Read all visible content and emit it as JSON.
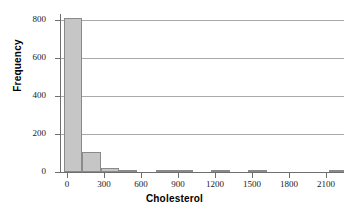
{
  "chart_data": {
    "type": "bar",
    "title": "",
    "subtitle": "",
    "xlabel": "Cholesterol",
    "ylabel": "Frequency",
    "xlim": [
      -60,
      2250
    ],
    "ylim": [
      0,
      830
    ],
    "grid": "horizontal",
    "legend": "none",
    "bin_width": 150,
    "x_ticks": [
      0,
      300,
      600,
      900,
      1200,
      1500,
      1800,
      2100
    ],
    "x_tick_labels": [
      "0",
      "300",
      "600",
      "900",
      "1200",
      "1500",
      "1800",
      "2100"
    ],
    "y_ticks": [
      0,
      200,
      400,
      600,
      800
    ],
    "y_tick_labels": [
      "0",
      "200",
      "400",
      "600",
      "800"
    ],
    "bins": [
      {
        "start": -30,
        "end": 120,
        "center": 45,
        "value": 810
      },
      {
        "start": 120,
        "end": 270,
        "center": 195,
        "value": 105
      },
      {
        "start": 270,
        "end": 420,
        "center": 345,
        "value": 20
      },
      {
        "start": 420,
        "end": 570,
        "center": 495,
        "value": 5
      },
      {
        "start": 720,
        "end": 870,
        "center": 795,
        "value": 8
      },
      {
        "start": 870,
        "end": 1020,
        "center": 945,
        "value": 3
      },
      {
        "start": 1170,
        "end": 1320,
        "center": 1245,
        "value": 2
      },
      {
        "start": 1470,
        "end": 1620,
        "center": 1545,
        "value": 2
      },
      {
        "start": 2130,
        "end": 2250,
        "center": 2190,
        "value": 3
      }
    ],
    "categories": [
      "45",
      "195",
      "345",
      "495",
      "795",
      "945",
      "1245",
      "1545",
      "2190"
    ],
    "values": [
      810,
      105,
      20,
      5,
      8,
      3,
      2,
      2,
      3
    ],
    "colors": {
      "bar_fill": "#c6c6c6",
      "bar_edge": "#8a8a8a",
      "gridline": "#a9a9a9",
      "axis": "#6e6e6e",
      "text": "#000000",
      "background": "#ffffff"
    }
  }
}
